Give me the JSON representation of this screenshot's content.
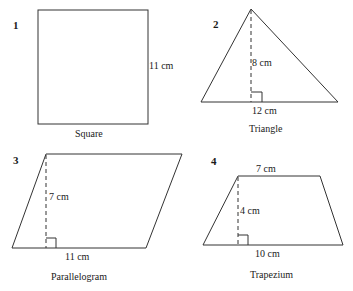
{
  "figures": [
    {
      "number": "1",
      "name": "Square",
      "shape": "square",
      "dimensions": {
        "side": "11 cm"
      }
    },
    {
      "number": "2",
      "name": "Triangle",
      "shape": "triangle",
      "dimensions": {
        "height": "8 cm",
        "base": "12 cm"
      }
    },
    {
      "number": "3",
      "name": "Parallelogram",
      "shape": "parallelogram",
      "dimensions": {
        "height": "7 cm",
        "base": "11 cm"
      }
    },
    {
      "number": "4",
      "name": "Trapezium",
      "shape": "trapezium",
      "dimensions": {
        "top": "7 cm",
        "height": "4 cm",
        "base": "10 cm"
      }
    }
  ],
  "colors": {
    "stroke": "#333333",
    "background": "#ffffff"
  }
}
